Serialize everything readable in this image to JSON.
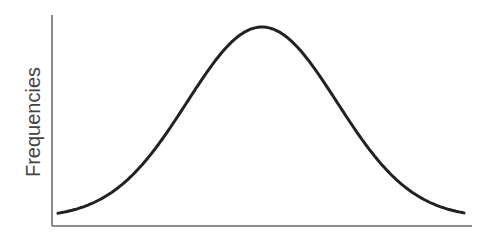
{
  "chart_data": {
    "type": "line",
    "title": "",
    "xlabel": "",
    "ylabel": "Frequencies",
    "grid": false,
    "legend": null,
    "series": [
      {
        "name": "normal-distribution",
        "mean_px": 262,
        "sigma_px": 75,
        "x_range_px": [
          58,
          465
        ],
        "baseline_px": 218,
        "peak_px": 27
      }
    ],
    "axes": {
      "origin": [
        52,
        226
      ],
      "y_top": 15,
      "x_right": 472
    },
    "colors": {
      "curve": "#222222",
      "axis": "#666666",
      "label": "#444444"
    }
  }
}
